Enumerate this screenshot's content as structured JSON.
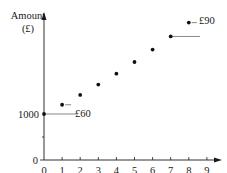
{
  "chart_data": {
    "type": "scatter",
    "title": "",
    "xlabel": "Number of years",
    "ylabel": "Amount (£)",
    "ylabel_lines": [
      "Amount",
      "(£)"
    ],
    "x": [
      0,
      1,
      2,
      3,
      4,
      5,
      6,
      7,
      8
    ],
    "values": [
      1000,
      1060,
      1124,
      1191,
      1262,
      1338,
      1419,
      1504,
      1594
    ],
    "x_ticks": [
      "0",
      "1",
      "2",
      "3",
      "4",
      "5",
      "6",
      "7",
      "8",
      "9"
    ],
    "y_ticks": [
      "0",
      "1000"
    ],
    "xlim": [
      0,
      9
    ],
    "ylim": [
      0,
      1650
    ],
    "grid": false,
    "legend": "none",
    "y_axis_break": true,
    "annotations": [
      {
        "text": "£60",
        "x": 1,
        "y": 1060,
        "note": "increase from year 0 to year 1"
      },
      {
        "text": "£90",
        "x": 8,
        "y": 1594,
        "note": "increase from year 7 to year 8"
      }
    ]
  }
}
